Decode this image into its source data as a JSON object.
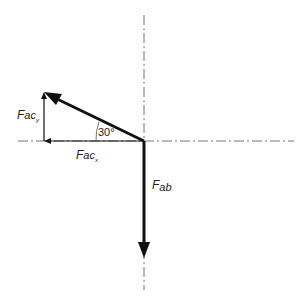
{
  "diagram": {
    "type": "force-vector-diagram",
    "labels": {
      "fac_y": {
        "main": "F",
        "sub": "ac",
        "subsub": "y"
      },
      "fac_x": {
        "main": "F",
        "sub": "ac",
        "subsub": "x"
      },
      "fab": {
        "main": "F",
        "sub": "ab"
      },
      "angle": "30°"
    },
    "colors": {
      "vector": "#111111",
      "centerline": "#777777",
      "text": "#222222"
    }
  }
}
